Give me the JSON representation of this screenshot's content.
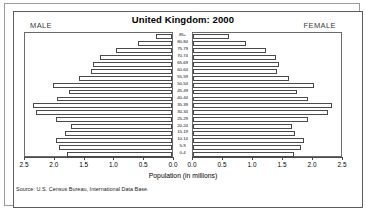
{
  "chart_title": "United Kingdom: 2000",
  "male_label": "MALE",
  "female_label": "FEMALE",
  "axis_caption": "Population (in millions)",
  "source": "Source: U.S. Census Bureau, International Data Base.",
  "chart_data": {
    "type": "bar",
    "subtype": "population-pyramid",
    "title": "United Kingdom: 2000",
    "xlabel": "Population (in millions)",
    "ylabel": "",
    "xlim": [
      0,
      2.5
    ],
    "xticks": [
      2.5,
      2.0,
      1.5,
      1.0,
      0.5,
      0.0
    ],
    "xticks_right": [
      0.0,
      0.5,
      1.0,
      1.5,
      2.0,
      2.5
    ],
    "grid": false,
    "legend": "none",
    "categories": [
      "0-4",
      "5-9",
      "10-14",
      "15-19",
      "20-24",
      "25-29",
      "30-34",
      "35-39",
      "40-44",
      "45-49",
      "50-54",
      "55-59",
      "60-64",
      "65-69",
      "70-74",
      "75-79",
      "80-84",
      "85+"
    ],
    "series": [
      {
        "name": "MALE",
        "side": "left",
        "values": [
          1.78,
          1.92,
          1.98,
          1.82,
          1.72,
          1.98,
          2.31,
          2.36,
          1.95,
          1.76,
          2.03,
          1.58,
          1.37,
          1.35,
          1.23,
          0.96,
          0.58,
          0.28
        ]
      },
      {
        "name": "FEMALE",
        "side": "right",
        "values": [
          1.7,
          1.83,
          1.88,
          1.73,
          1.67,
          1.94,
          2.28,
          2.34,
          1.94,
          1.76,
          2.05,
          1.62,
          1.42,
          1.46,
          1.41,
          1.24,
          0.9,
          0.6
        ]
      }
    ]
  },
  "colors": {
    "bar_fill": "#ffffff",
    "bar_stroke": "#4a4a4a",
    "frame": "#5d5d5d",
    "text": "#000000"
  }
}
